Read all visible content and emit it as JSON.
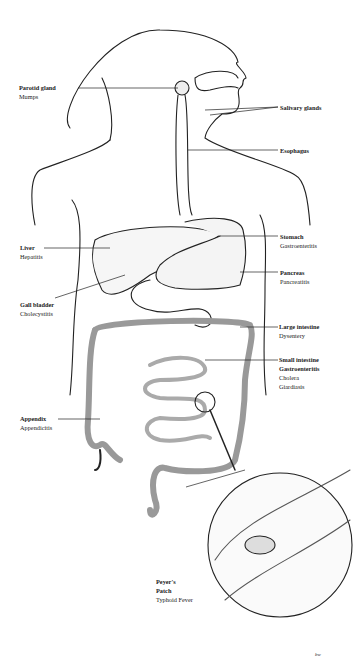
{
  "diagram": {
    "labels": [
      {
        "organ": "Parotid gland",
        "diseases": [
          "Mumps"
        ]
      },
      {
        "organ": "Salivary glands",
        "diseases": []
      },
      {
        "organ": "Esophagus",
        "diseases": []
      },
      {
        "organ": "Liver",
        "diseases": [
          "Hepatitis"
        ]
      },
      {
        "organ": "Stomach",
        "diseases": [
          "Gastroenteritis"
        ]
      },
      {
        "organ": "Pancreas",
        "diseases": [
          "Pancreatitis"
        ]
      },
      {
        "organ": "Gall bladder",
        "diseases": [
          "Cholecystitis"
        ]
      },
      {
        "organ": "Large intestine",
        "diseases": [
          "Dysentery"
        ]
      },
      {
        "organ": "Small intestine",
        "diseases": [
          "Gastroenteritis",
          "Cholera",
          "Giardiasis"
        ]
      },
      {
        "organ": "Appendix",
        "diseases": [
          "Appendicitis"
        ]
      },
      {
        "organ": "Peyer's Patch",
        "diseases": [
          "Typhoid Fever"
        ]
      }
    ],
    "signature": "bw"
  }
}
